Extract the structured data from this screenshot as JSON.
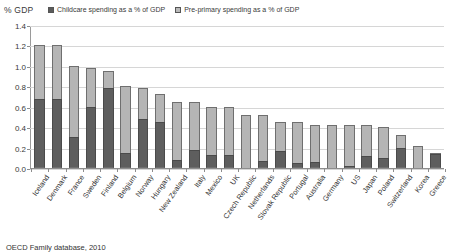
{
  "chart_data": {
    "type": "bar",
    "stacked": true,
    "title": "",
    "ylabel": "% GDP",
    "xlabel": "",
    "ylim": [
      0,
      1.4
    ],
    "ytick_step": 0.2,
    "ytick_labels": [
      "0.0",
      "0.2",
      "0.4",
      "0.6",
      "0.8",
      "1.0",
      "1.2",
      "1.4"
    ],
    "grid": true,
    "legend_position": "top",
    "categories": [
      "Iceland",
      "Denmark",
      "France",
      "Sweden",
      "Finland",
      "Belgium",
      "Norway",
      "Hungary",
      "New Zealand",
      "Italy",
      "Mexico",
      "UK",
      "Czech Republic",
      "Netherlands",
      "Slovak Republic",
      "Portugal",
      "Australia",
      "Germany",
      "US",
      "Japan",
      "Poland",
      "Switzerland",
      "Korea",
      "Greece"
    ],
    "series": [
      {
        "name": "Childcare spending as a % of GDP",
        "color": "#5e5e5e",
        "values": [
          0.68,
          0.68,
          0.3,
          0.6,
          0.78,
          0.15,
          0.48,
          0.45,
          0.08,
          0.18,
          0.13,
          0.13,
          0.0,
          0.07,
          0.17,
          0.05,
          0.06,
          0.0,
          0.02,
          0.12,
          0.1,
          0.2,
          0.0,
          0.14
        ]
      },
      {
        "name": "Pre-primary spending as a % of GDP",
        "color": "#b5b5b5",
        "values": [
          0.52,
          0.52,
          0.7,
          0.38,
          0.17,
          0.65,
          0.3,
          0.27,
          0.57,
          0.47,
          0.47,
          0.47,
          0.52,
          0.45,
          0.28,
          0.4,
          0.36,
          0.42,
          0.4,
          0.3,
          0.3,
          0.12,
          0.22,
          0.01
        ]
      }
    ],
    "totals": [
      1.2,
      1.2,
      1.0,
      0.98,
      0.95,
      0.8,
      0.78,
      0.72,
      0.65,
      0.65,
      0.6,
      0.6,
      0.52,
      0.52,
      0.45,
      0.45,
      0.42,
      0.42,
      0.42,
      0.42,
      0.4,
      0.32,
      0.22,
      0.15
    ]
  },
  "legend": {
    "items": [
      {
        "label": "Childcare spending as a % of GDP"
      },
      {
        "label": "Pre-primary spending as a % of GDP"
      }
    ]
  },
  "axis": {
    "y_title": "% GDP"
  },
  "source_note": "OECD Family database, 2010"
}
